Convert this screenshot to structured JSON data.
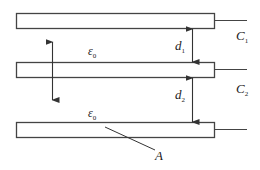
{
  "diagram": {
    "type": "parallel-plate capacitors",
    "stroke_color": "#444444",
    "plates": [
      {
        "id": "plate-top",
        "x": 16,
        "y": 13,
        "width": 198,
        "height": 15
      },
      {
        "id": "plate-middle",
        "x": 16,
        "y": 62,
        "width": 198,
        "height": 15
      },
      {
        "id": "plate-bottom",
        "x": 16,
        "y": 122,
        "width": 198,
        "height": 15
      }
    ],
    "labels": {
      "c1": {
        "base": "C",
        "sub": "1"
      },
      "c2": {
        "base": "C",
        "sub": "2"
      },
      "d1": {
        "base": "d",
        "sub": "1"
      },
      "d2": {
        "base": "d",
        "sub": "2"
      },
      "eps_top": {
        "base": "ε",
        "sub": "0"
      },
      "eps_bottom": {
        "base": "ε",
        "sub": "0"
      },
      "area": "A"
    }
  }
}
